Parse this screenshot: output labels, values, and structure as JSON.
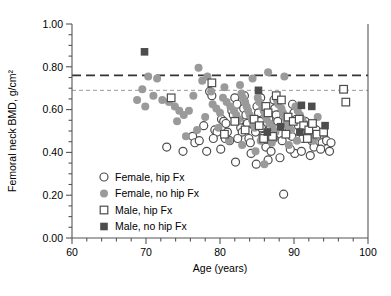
{
  "figure": {
    "width": 391,
    "height": 296,
    "background": "#ffffff",
    "plot_area": {
      "left": 72,
      "right": 368,
      "top": 24,
      "bottom": 238
    }
  },
  "chart_data": {
    "type": "scatter",
    "title": "",
    "xlabel": "Age (years)",
    "ylabel": "Femoral neck BMD, g/cm²",
    "xlim": [
      60,
      100
    ],
    "ylim": [
      0.0,
      1.0
    ],
    "xticks": [
      60,
      70,
      80,
      90,
      100
    ],
    "xtick_labels": [
      "60",
      "70",
      "80",
      "90",
      "100"
    ],
    "x_minor_step": 2,
    "yticks": [
      0.0,
      0.2,
      0.4,
      0.6,
      0.8,
      1.0
    ],
    "ytick_labels": [
      "0.00",
      "0.20",
      "0.40",
      "0.60",
      "0.80",
      "1.00"
    ],
    "y_minor_step": 0.05,
    "grid": false,
    "legend_position": "lower-left-inside",
    "colors": {
      "open_marker_edge": "#4d4d4d",
      "filled_gray": "#9a9a9a",
      "filled_dark": "#4d4d4d",
      "axis": "#555555",
      "reference_line_dark": "#333333",
      "reference_line_light": "#9a9a9a"
    },
    "reference_lines": [
      {
        "name": "male-threshold",
        "y": 0.76,
        "style": "dashed-long",
        "color": "#333333",
        "width": 1.8
      },
      {
        "name": "female-threshold",
        "y": 0.69,
        "style": "dashed-short",
        "color": "#9a9a9a",
        "width": 1.0
      }
    ],
    "legend": [
      {
        "marker": "open-circle",
        "label": "Female, hip Fx"
      },
      {
        "marker": "filled-circle",
        "label": "Female, no hip Fx"
      },
      {
        "marker": "open-square",
        "label": "Male, hip Fx"
      },
      {
        "marker": "filled-square",
        "label": "Male, no hip Fx"
      }
    ],
    "series": [
      {
        "name": "Female, hip Fx",
        "marker": "open-circle",
        "points": [
          [
            72.8,
            0.425
          ],
          [
            75.0,
            0.405
          ],
          [
            76.3,
            0.475
          ],
          [
            76.6,
            0.445
          ],
          [
            77.2,
            0.455
          ],
          [
            78.6,
            0.685
          ],
          [
            78.9,
            0.665
          ],
          [
            79.3,
            0.505
          ],
          [
            79.6,
            0.495
          ],
          [
            80.2,
            0.555
          ],
          [
            80.5,
            0.545
          ],
          [
            80.8,
            0.535
          ],
          [
            81.0,
            0.495
          ],
          [
            81.3,
            0.455
          ],
          [
            81.6,
            0.595
          ],
          [
            81.8,
            0.575
          ],
          [
            82.0,
            0.655
          ],
          [
            82.3,
            0.625
          ],
          [
            82.6,
            0.545
          ],
          [
            82.8,
            0.515
          ],
          [
            83.0,
            0.495
          ],
          [
            83.2,
            0.605
          ],
          [
            83.5,
            0.575
          ],
          [
            83.7,
            0.535
          ],
          [
            83.9,
            0.465
          ],
          [
            84.1,
            0.445
          ],
          [
            84.4,
            0.555
          ],
          [
            84.6,
            0.525
          ],
          [
            84.8,
            0.495
          ],
          [
            85.0,
            0.615
          ],
          [
            85.2,
            0.585
          ],
          [
            85.4,
            0.545
          ],
          [
            85.6,
            0.515
          ],
          [
            85.8,
            0.475
          ],
          [
            86.0,
            0.455
          ],
          [
            86.2,
            0.425
          ],
          [
            86.4,
            0.585
          ],
          [
            86.6,
            0.555
          ],
          [
            86.8,
            0.525
          ],
          [
            87.0,
            0.495
          ],
          [
            87.2,
            0.465
          ],
          [
            87.4,
            0.605
          ],
          [
            87.6,
            0.575
          ],
          [
            87.8,
            0.545
          ],
          [
            88.0,
            0.515
          ],
          [
            88.2,
            0.485
          ],
          [
            88.4,
            0.455
          ],
          [
            88.6,
            0.205
          ],
          [
            88.9,
            0.565
          ],
          [
            89.1,
            0.535
          ],
          [
            89.4,
            0.505
          ],
          [
            89.7,
            0.475
          ],
          [
            90.0,
            0.585
          ],
          [
            90.3,
            0.555
          ],
          [
            90.6,
            0.525
          ],
          [
            90.9,
            0.495
          ],
          [
            91.2,
            0.465
          ],
          [
            91.5,
            0.545
          ],
          [
            91.8,
            0.515
          ],
          [
            92.1,
            0.485
          ],
          [
            92.4,
            0.455
          ],
          [
            92.7,
            0.425
          ],
          [
            93.0,
            0.505
          ],
          [
            93.4,
            0.475
          ],
          [
            93.8,
            0.445
          ],
          [
            94.4,
            0.455
          ],
          [
            95.0,
            0.445
          ],
          [
            82.1,
            0.355
          ],
          [
            84.9,
            0.345
          ],
          [
            86.5,
            0.365
          ],
          [
            88.1,
            0.375
          ],
          [
            90.1,
            0.395
          ],
          [
            92.2,
            0.385
          ],
          [
            93.6,
            0.415
          ],
          [
            80.1,
            0.415
          ],
          [
            78.2,
            0.405
          ],
          [
            84.2,
            0.395
          ],
          [
            86.9,
            0.405
          ],
          [
            89.5,
            0.415
          ],
          [
            91.0,
            0.405
          ],
          [
            83.3,
            0.665
          ],
          [
            85.5,
            0.655
          ],
          [
            87.3,
            0.645
          ],
          [
            89.8,
            0.625
          ],
          [
            77.8,
            0.525
          ],
          [
            79.1,
            0.465
          ],
          [
            80.7,
            0.465
          ],
          [
            82.4,
            0.465
          ],
          [
            94.8,
            0.405
          ]
        ]
      },
      {
        "name": "Female, no hip Fx",
        "marker": "filled-circle",
        "points": [
          [
            68.8,
            0.645
          ],
          [
            69.5,
            0.695
          ],
          [
            70.3,
            0.755
          ],
          [
            71.5,
            0.745
          ],
          [
            72.2,
            0.645
          ],
          [
            73.1,
            0.635
          ],
          [
            73.9,
            0.615
          ],
          [
            74.5,
            0.595
          ],
          [
            75.1,
            0.575
          ],
          [
            75.8,
            0.595
          ],
          [
            76.4,
            0.665
          ],
          [
            77.1,
            0.795
          ],
          [
            77.6,
            0.735
          ],
          [
            78.3,
            0.755
          ],
          [
            79.0,
            0.625
          ],
          [
            79.5,
            0.605
          ],
          [
            80.0,
            0.585
          ],
          [
            80.4,
            0.655
          ],
          [
            80.9,
            0.635
          ],
          [
            81.4,
            0.615
          ],
          [
            81.9,
            0.595
          ],
          [
            82.2,
            0.575
          ],
          [
            82.5,
            0.555
          ],
          [
            82.9,
            0.675
          ],
          [
            83.1,
            0.655
          ],
          [
            83.4,
            0.635
          ],
          [
            83.6,
            0.615
          ],
          [
            83.8,
            0.595
          ],
          [
            84.0,
            0.575
          ],
          [
            84.3,
            0.555
          ],
          [
            84.5,
            0.535
          ],
          [
            84.7,
            0.515
          ],
          [
            85.1,
            0.655
          ],
          [
            85.3,
            0.635
          ],
          [
            85.7,
            0.615
          ],
          [
            85.9,
            0.595
          ],
          [
            86.1,
            0.575
          ],
          [
            86.3,
            0.555
          ],
          [
            86.7,
            0.535
          ],
          [
            87.1,
            0.515
          ],
          [
            87.5,
            0.495
          ],
          [
            87.7,
            0.645
          ],
          [
            87.9,
            0.625
          ],
          [
            88.3,
            0.605
          ],
          [
            88.5,
            0.585
          ],
          [
            88.8,
            0.565
          ],
          [
            89.0,
            0.545
          ],
          [
            89.2,
            0.525
          ],
          [
            89.6,
            0.505
          ],
          [
            90.2,
            0.615
          ],
          [
            90.5,
            0.595
          ],
          [
            90.8,
            0.575
          ],
          [
            91.1,
            0.555
          ],
          [
            91.4,
            0.535
          ],
          [
            91.7,
            0.515
          ],
          [
            92.0,
            0.495
          ],
          [
            92.3,
            0.475
          ],
          [
            92.6,
            0.455
          ],
          [
            93.2,
            0.565
          ],
          [
            86.5,
            0.775
          ],
          [
            88.7,
            0.755
          ],
          [
            84.4,
            0.745
          ],
          [
            82.7,
            0.715
          ],
          [
            80.6,
            0.705
          ],
          [
            78.8,
            0.685
          ],
          [
            76.9,
            0.505
          ],
          [
            75.4,
            0.475
          ],
          [
            74.2,
            0.545
          ],
          [
            71.0,
            0.665
          ],
          [
            69.9,
            0.615
          ],
          [
            85.5,
            0.455
          ],
          [
            87.0,
            0.445
          ],
          [
            89.3,
            0.435
          ],
          [
            83.0,
            0.435
          ],
          [
            81.2,
            0.455
          ],
          [
            79.8,
            0.515
          ],
          [
            78.0,
            0.565
          ],
          [
            86.0,
            0.345
          ],
          [
            84.8,
            0.405
          ],
          [
            90.4,
            0.455
          ]
        ]
      },
      {
        "name": "Male, hip Fx",
        "marker": "open-square",
        "points": [
          [
            73.4,
            0.655
          ],
          [
            78.9,
            0.725
          ],
          [
            86.2,
            0.615
          ],
          [
            86.5,
            0.585
          ],
          [
            87.6,
            0.665
          ],
          [
            88.3,
            0.645
          ],
          [
            89.2,
            0.565
          ],
          [
            89.9,
            0.545
          ],
          [
            90.7,
            0.555
          ],
          [
            91.3,
            0.525
          ],
          [
            92.0,
            0.505
          ],
          [
            92.5,
            0.535
          ],
          [
            93.1,
            0.485
          ],
          [
            96.7,
            0.695
          ],
          [
            97.0,
            0.635
          ],
          [
            84.6,
            0.555
          ],
          [
            85.3,
            0.525
          ],
          [
            83.4,
            0.505
          ],
          [
            82.0,
            0.545
          ],
          [
            80.6,
            0.485
          ],
          [
            88.9,
            0.485
          ],
          [
            91.8,
            0.465
          ],
          [
            87.1,
            0.475
          ],
          [
            85.9,
            0.465
          ],
          [
            94.0,
            0.495
          ]
        ]
      },
      {
        "name": "Male, no hip Fx",
        "marker": "filled-square",
        "points": [
          [
            69.8,
            0.87
          ],
          [
            85.2,
            0.69
          ],
          [
            91.0,
            0.62
          ],
          [
            92.4,
            0.615
          ],
          [
            88.2,
            0.52
          ],
          [
            90.8,
            0.495
          ],
          [
            86.4,
            0.495
          ],
          [
            94.2,
            0.525
          ]
        ]
      }
    ]
  }
}
